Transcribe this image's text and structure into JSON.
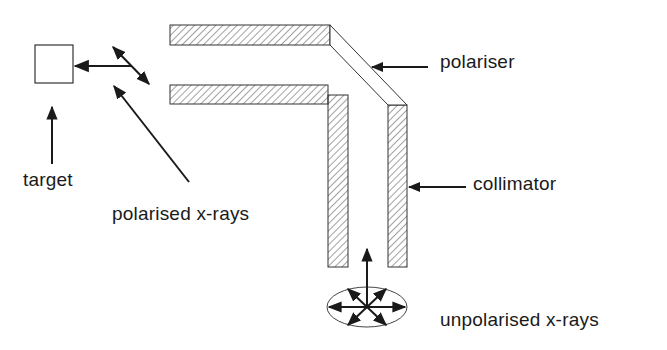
{
  "diagram": {
    "type": "schematic",
    "colors": {
      "ink": "#1a1a1a",
      "background": "#ffffff",
      "hatch": "#444444"
    },
    "labels": {
      "target": "target",
      "polarised": "polarised x-rays",
      "polariser": "polariser",
      "collimator": "collimator",
      "unpolarised": "unpolarised x-rays"
    },
    "components": [
      {
        "id": "target-box",
        "name": "target"
      },
      {
        "id": "collimator-upper-arm",
        "name": "collimator"
      },
      {
        "id": "collimator-lower-arm",
        "name": "collimator"
      },
      {
        "id": "polariser-band",
        "name": "polariser"
      },
      {
        "id": "unpolarised-source",
        "name": "unpolarised x-rays"
      }
    ]
  }
}
